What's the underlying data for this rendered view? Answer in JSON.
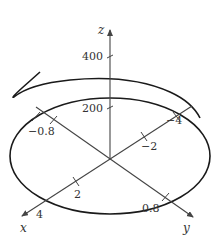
{
  "figure": {
    "type": "3d-parametric-curve",
    "colors": {
      "curve": "#1a1a1a",
      "axes": "#444444",
      "text": "#333333",
      "background": "#ffffff"
    },
    "axes": {
      "x": {
        "label": "x",
        "ticks": [
          "2",
          "4",
          "-2",
          "-4"
        ]
      },
      "y": {
        "label": "y",
        "ticks": [
          "0.8",
          "-0.8"
        ]
      },
      "z": {
        "label": "z",
        "ticks": [
          "200",
          "400"
        ]
      }
    },
    "labels": {
      "z": "z",
      "x": "x",
      "y": "y",
      "z400": "400",
      "z200": "200",
      "xneg4": "−4",
      "xneg2": "−2",
      "x2": "2",
      "x4": "4",
      "y08": "0.8",
      "yneg08": "−0.8"
    }
  }
}
